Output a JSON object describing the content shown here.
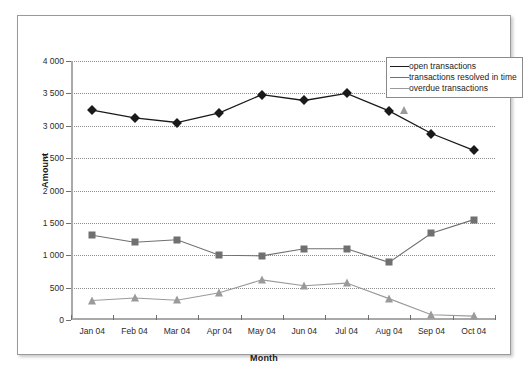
{
  "chart_data": {
    "type": "line",
    "title": "",
    "subtitle": "",
    "xlabel": "Month",
    "ylabel": "Amount",
    "categories": [
      "Jan 04",
      "Feb 04",
      "Mar 04",
      "Apr 04",
      "May 04",
      "Jun 04",
      "Jul 04",
      "Aug 04",
      "Sep 04",
      "Oct 04"
    ],
    "ylim": [
      0,
      4000
    ],
    "ytick_values": [
      0,
      500,
      1000,
      1500,
      2000,
      2500,
      3000,
      3500,
      4000
    ],
    "ytick_labels": [
      "0",
      "500",
      "1 000",
      "1 500",
      "2 000",
      "2 500",
      "3 000",
      "3 500",
      "4 000"
    ],
    "grid": true,
    "grid_style": "dotted-horizontal",
    "legend_position": "top-right",
    "series": [
      {
        "name": "open transactions",
        "marker": "diamond",
        "color": "#1a1a1a",
        "values": [
          3240,
          3120,
          3050,
          3200,
          3480,
          3390,
          3500,
          3230,
          2880,
          2620
        ]
      },
      {
        "name": "transactions resolved in time",
        "marker": "square",
        "color": "#707070",
        "values": [
          1310,
          1200,
          1240,
          1000,
          990,
          1100,
          1100,
          890,
          1340,
          1550
        ]
      },
      {
        "name": "overdue transactions",
        "marker": "triangle",
        "color": "#9a9a9a",
        "values": [
          300,
          340,
          305,
          420,
          620,
          530,
          570,
          330,
          80,
          60
        ]
      }
    ]
  },
  "legend": {
    "entries": [
      {
        "label": "open transactions"
      },
      {
        "label": "transactions resolved in time"
      },
      {
        "label": "overdue transactions"
      }
    ]
  },
  "axes": {
    "y_title": "Amount",
    "x_title": "Month"
  },
  "caption": {
    "text": ""
  }
}
